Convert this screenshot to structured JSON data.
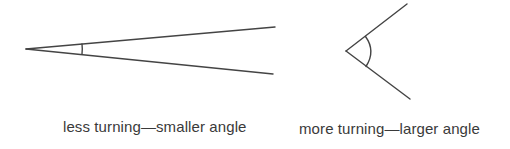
{
  "diagram": {
    "colors": {
      "line": "#444444",
      "text": "#3a3a3a",
      "background": "#ffffff"
    },
    "figures": [
      {
        "id": "small-angle",
        "caption": "less turning—smaller angle",
        "vertex": [
          26,
          49
        ],
        "ray_ends": [
          [
            275,
            27
          ],
          [
            273,
            74
          ]
        ],
        "arc_mark": "small tick arc near vertex"
      },
      {
        "id": "large-angle",
        "caption": "more turning—larger angle",
        "vertex": [
          346,
          51
        ],
        "ray_ends": [
          [
            407,
            4
          ],
          [
            410,
            99
          ]
        ],
        "arc_mark": "curved arc near vertex"
      }
    ]
  }
}
